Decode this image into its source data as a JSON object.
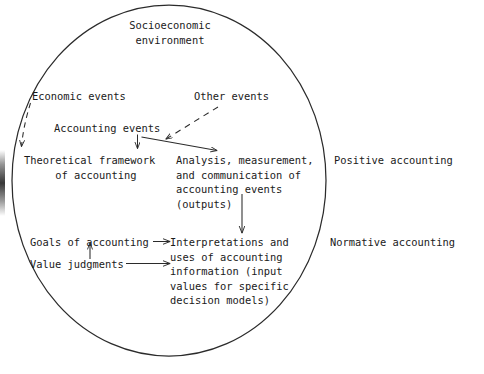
{
  "figure": {
    "type": "conceptual-diagram",
    "shape": "ellipse",
    "boundary_label": "socioeconomic-environment-ellipse"
  },
  "labels": {
    "socioeconomic_environment": "Socioeconomic\nenvironment",
    "economic_events": "Economic events",
    "other_events": "Other events",
    "accounting_events": "Accounting events",
    "theoretical_framework": "Theoretical framework\n     of accounting",
    "analysis_measurement": "Analysis, measurement,\nand communication of\naccounting events\n(outputs)",
    "goals_of_accounting": "Goals of accounting",
    "value_judgments": "Value judgments",
    "interpretations_uses": "Interpretations and\nuses of accounting\ninformation (input\nvalues for specific\ndecision models)",
    "positive_accounting": "Positive accounting",
    "normative_accounting": "Normative accounting"
  },
  "connectors": [
    {
      "name": "economic-events-to-theoretical-framework",
      "style": "dashed",
      "from": "economic_events",
      "to": "theoretical_framework",
      "arrowhead": true
    },
    {
      "name": "other-events-to-accounting-events",
      "style": "dashed",
      "from": "other_events",
      "to": "accounting_events",
      "arrowhead": true
    },
    {
      "name": "accounting-events-to-theoretical-framework",
      "style": "solid",
      "from": "accounting_events",
      "to": "theoretical_framework",
      "arrowhead": true
    },
    {
      "name": "accounting-events-to-analysis",
      "style": "solid",
      "from": "accounting_events",
      "to": "analysis_measurement",
      "arrowhead": true
    },
    {
      "name": "analysis-to-interpretations",
      "style": "solid",
      "from": "analysis_measurement",
      "to": "interpretations_uses",
      "arrowhead": true
    },
    {
      "name": "goals-to-interpretations",
      "style": "solid",
      "from": "goals_of_accounting",
      "to": "interpretations_uses",
      "arrowhead": true
    },
    {
      "name": "value-judgments-to-interpretations",
      "style": "solid",
      "from": "value_judgments",
      "to": "interpretations_uses",
      "arrowhead": true
    },
    {
      "name": "value-judgments-to-goals",
      "style": "solid",
      "from": "value_judgments",
      "to": "goals_of_accounting",
      "arrowhead": true
    }
  ],
  "colors": {
    "ink": "#1a1a1a",
    "stroke": "#2b2b2b",
    "background": "#ffffff"
  }
}
